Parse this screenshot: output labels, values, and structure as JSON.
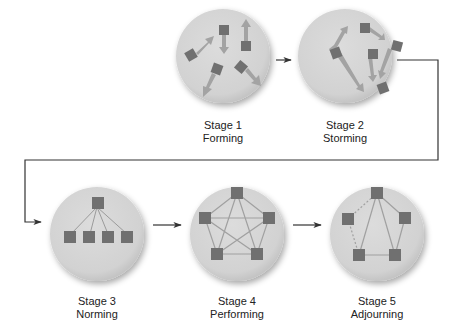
{
  "colors": {
    "background": "#ffffff",
    "circle_fill": "#d6d6d6",
    "circle_shadow": "#b8b8b8",
    "node": "#707070",
    "arrow_fill": "#a6a6a6",
    "edge": "#a0a0a0",
    "connector": "#333333",
    "text": "#222222"
  },
  "stages": [
    {
      "number_label": "Stage 1",
      "name": "Forming",
      "cx": 223,
      "cy": 56,
      "label_top": 119
    },
    {
      "number_label": "Stage 2",
      "name": "Storming",
      "cx": 345,
      "cy": 56,
      "label_top": 119
    },
    {
      "number_label": "Stage 3",
      "name": "Norming",
      "cx": 97,
      "cy": 234,
      "label_top": 295
    },
    {
      "number_label": "Stage 4",
      "name": "Performing",
      "cx": 237,
      "cy": 234,
      "label_top": 295
    },
    {
      "number_label": "Stage 5",
      "name": "Adjourning",
      "cx": 377,
      "cy": 234,
      "label_top": 295
    }
  ],
  "connectors": [
    {
      "from": "Stage 1",
      "to": "Stage 2",
      "type": "straight"
    },
    {
      "from": "Stage 2",
      "to": "Stage 3",
      "type": "elbow"
    },
    {
      "from": "Stage 3",
      "to": "Stage 4",
      "type": "straight"
    },
    {
      "from": "Stage 4",
      "to": "Stage 5",
      "type": "straight"
    }
  ],
  "radius": 47
}
